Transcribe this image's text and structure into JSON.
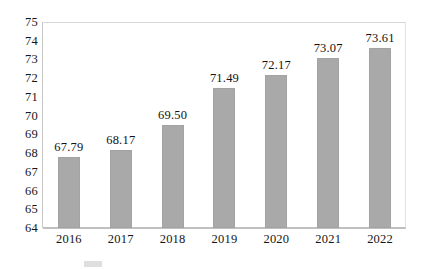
{
  "chart_data": {
    "type": "bar",
    "title": "",
    "xlabel": "",
    "ylabel": "",
    "categories": [
      "2016",
      "2017",
      "2018",
      "2019",
      "2020",
      "2021",
      "2022"
    ],
    "values": [
      67.79,
      68.17,
      69.5,
      71.49,
      72.17,
      73.07,
      73.61
    ],
    "value_labels": [
      "67.79",
      "68.17",
      "69.50",
      "71.49",
      "72.17",
      "73.07",
      "73.61"
    ],
    "ylim": [
      64,
      75
    ],
    "ytick_step": 1,
    "ytick_labels": [
      "75",
      "74",
      "73",
      "72",
      "71",
      "70",
      "69",
      "68",
      "67",
      "66",
      "65",
      "64"
    ],
    "grid": true,
    "grid_axis": "y",
    "legend": false,
    "legend_position": "bottom",
    "series": [
      {
        "name": "",
        "values": [
          67.79,
          68.17,
          69.5,
          71.49,
          72.17,
          73.07,
          73.61
        ]
      }
    ]
  },
  "style": {
    "bar_color": "#a9a9a9",
    "bar_edge_color": "#a2a2a2",
    "gridline_color": "#e9e9e9",
    "axis_color": "#c0c0c0",
    "text_color": "#161616",
    "background": "#ffffff"
  },
  "caption": {
    "fragment": ""
  }
}
